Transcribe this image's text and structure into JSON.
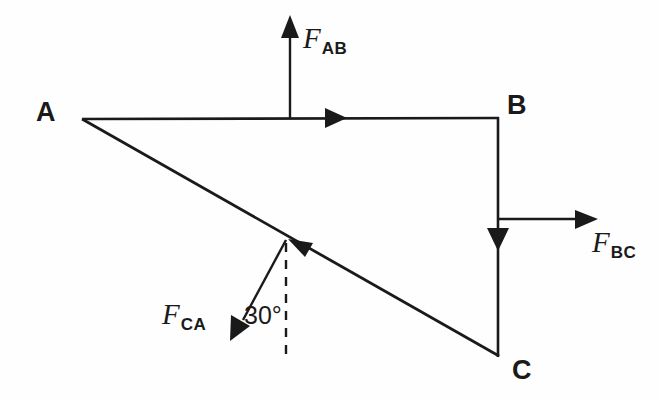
{
  "diagram": {
    "background_color": "#fefefe",
    "stroke_color": "#1a1a1a",
    "vertices": [
      {
        "name": "A",
        "label": "A",
        "x": 82,
        "y": 119
      },
      {
        "name": "B",
        "label": "B",
        "x": 498,
        "y": 118
      },
      {
        "name": "C",
        "label": "C",
        "x": 498,
        "y": 356
      }
    ],
    "vertex_labels": [
      {
        "name": "vertex-label-a",
        "text": "A",
        "x": 36,
        "y": 99
      },
      {
        "name": "vertex-label-b",
        "text": "B",
        "x": 507,
        "y": 92
      },
      {
        "name": "vertex-label-c",
        "text": "C",
        "x": 512,
        "y": 357
      }
    ],
    "members": [
      {
        "name": "member-ab",
        "from": "A",
        "to": "B",
        "direction": "A to B",
        "arrow_at": {
          "x": 342,
          "y": 118
        }
      },
      {
        "name": "member-bc",
        "from": "B",
        "to": "C",
        "direction": "B to C",
        "arrow_at": {
          "x": 498,
          "y": 243
        }
      },
      {
        "name": "member-ca",
        "from": "C",
        "to": "A",
        "direction": "C to A",
        "arrow_at": {
          "x": 291,
          "y": 241
        }
      }
    ],
    "forces": [
      {
        "name": "force-ab",
        "symbol": "F",
        "subscript": "AB",
        "label_x": 303,
        "label_y": 24,
        "arrow": {
          "x1": 290,
          "y1": 118,
          "x2": 290,
          "y2": 18
        },
        "orientation": "vertical-up"
      },
      {
        "name": "force-bc",
        "symbol": "F",
        "subscript": "BC",
        "label_x": 592,
        "label_y": 228,
        "arrow": {
          "x1": 499,
          "y1": 219,
          "x2": 596,
          "y2": 219
        },
        "orientation": "horizontal-right"
      },
      {
        "name": "force-ca",
        "symbol": "F",
        "subscript": "CA",
        "label_x": 162,
        "label_y": 300,
        "arrow": {
          "x1": 286,
          "y1": 240,
          "x2": 233,
          "y2": 337
        },
        "orientation": "down-left-30-deg-from-vertical"
      }
    ],
    "annotations": [
      {
        "name": "angle-30",
        "text": "30°",
        "x": 244,
        "y": 303,
        "reference_line": "dashed vertical",
        "dashed_line": {
          "x1": 286,
          "y1": 240,
          "x2": 286,
          "y2": 361
        }
      }
    ]
  }
}
